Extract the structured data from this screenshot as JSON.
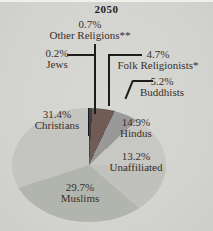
{
  "chart_data": {
    "type": "pie",
    "title": "2050",
    "unit": "%",
    "direction": "clockwise",
    "start_angle_deg": 0,
    "legend": "none",
    "label_style": "callout",
    "background_color": "#d3d3cf",
    "slices": [
      {
        "name": "Other Religions**",
        "value": 0.7,
        "pct_label": "0.7%",
        "color": "#3f3f46"
      },
      {
        "name": "Folk Religionists*",
        "value": 4.7,
        "pct_label": "4.7%",
        "color": "#715b55"
      },
      {
        "name": "Buddhists",
        "value": 5.2,
        "pct_label": "5.2%",
        "color": "#99999a"
      },
      {
        "name": "Hindus",
        "value": 14.9,
        "pct_label": "14.9%",
        "color": "#c7c7c3"
      },
      {
        "name": "Unaffiliated",
        "value": 13.2,
        "pct_label": "13.2%",
        "color": "#c0c0bc"
      },
      {
        "name": "Muslims",
        "value": 29.7,
        "pct_label": "29.7%",
        "color": "#b2b5ae"
      },
      {
        "name": "Christians",
        "value": 31.4,
        "pct_label": "31.4%",
        "color": "#c4c4c0"
      },
      {
        "name": "Jews",
        "value": 0.2,
        "pct_label": "0.2%",
        "color": "#1a1a1a"
      }
    ]
  }
}
